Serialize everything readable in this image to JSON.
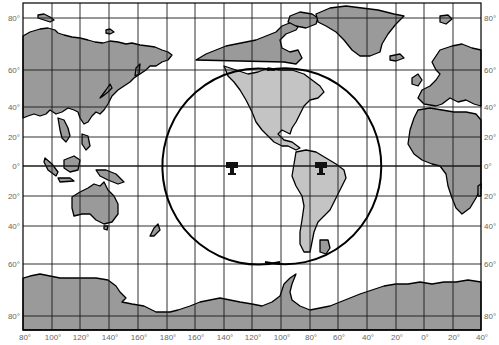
{
  "map": {
    "projection": "Mercator world map",
    "colors": {
      "land": "#9a9a9a",
      "highlight_land": "#c4c4c4",
      "ocean": "#ffffff",
      "grid": "#1a1a1a",
      "coverage": "#000000",
      "labels": "#666666"
    },
    "latitude_labels_left": [
      "80°",
      "60°",
      "40°",
      "20°",
      "0°",
      "20°",
      "40°",
      "60°",
      "80°"
    ],
    "latitude_labels_right": [
      "80°",
      "60°",
      "40°",
      "20°",
      "0°",
      "20°",
      "40°",
      "60°",
      "80°"
    ],
    "longitude_labels": [
      "80°",
      "100°",
      "120°",
      "140°",
      "160°",
      "180°",
      "160°",
      "140°",
      "120°",
      "100°",
      "80°",
      "60°",
      "40°",
      "20°",
      "0°",
      "20°",
      "40°"
    ],
    "markers": [
      {
        "name": "satellite-ground-station-pacific",
        "icon": "antenna-station-icon",
        "lon": "140°W",
        "lat": "0°"
      },
      {
        "name": "satellite-ground-station-south-america",
        "icon": "antenna-station-icon",
        "lon": "75°W",
        "lat": "0°"
      }
    ],
    "coverage_areas": "Two overlapping circular satellite coverage footprints centered over the equatorial Pacific and South America"
  }
}
